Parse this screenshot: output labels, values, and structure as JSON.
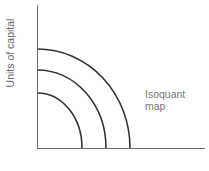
{
  "diagram": {
    "type": "isoquant-map",
    "y_axis_label": "Units of capital",
    "x_axis_label": "",
    "annotation": {
      "line1": "Isoquant",
      "line2": "map"
    },
    "colors": {
      "axis": "#666666",
      "curve": "#333333",
      "text": "#777777"
    },
    "curves": [
      {
        "name": "isoquant-1",
        "y_intercept_px": 93,
        "x_intercept_px": 82
      },
      {
        "name": "isoquant-2",
        "y_intercept_px": 70,
        "x_intercept_px": 106
      },
      {
        "name": "isoquant-3",
        "y_intercept_px": 49,
        "x_intercept_px": 130
      }
    ]
  }
}
